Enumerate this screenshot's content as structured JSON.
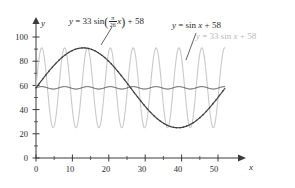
{
  "figure": {
    "background": "#ffffff",
    "axis_color": "#3a3a3a",
    "dark_curve_color": "#3f3f3f",
    "light_curve_color": "#c9c9c9",
    "faint_label_color": "#b9b9b9"
  },
  "axes": {
    "x_name": "x",
    "y_name": "y",
    "x_ticks": [
      "0",
      "10",
      "20",
      "30",
      "40",
      "50"
    ],
    "y_ticks": [
      "0",
      "20",
      "40",
      "60",
      "80",
      "100"
    ],
    "x_tick_values": [
      0,
      10,
      20,
      30,
      40,
      50
    ],
    "y_tick_values": [
      0,
      20,
      40,
      60,
      80,
      100
    ],
    "x_minor_step": 5,
    "y_minor_step": 10
  },
  "labels": {
    "slow_curve": {
      "prefix": "y",
      "equals": "=",
      "amplitude": "33",
      "fn": "sin",
      "open_paren": "(",
      "frac_num": "π",
      "frac_den": "26",
      "var": "x",
      "close_paren": ")",
      "plus": "+",
      "offset": "58",
      "full": "y = 33 sin(π/26 x) + 58"
    },
    "small_curve": {
      "full": "y = sin x + 58",
      "prefix": "y",
      "equals": "=",
      "fn": "sin",
      "var": "x",
      "plus": "+",
      "offset": "58"
    },
    "large_curve": {
      "full": "y = 33 sin x + 58",
      "prefix": "y",
      "equals": "=",
      "amplitude": "33",
      "fn": "sin",
      "var": "x",
      "plus": "+",
      "offset": "58"
    }
  },
  "chart_data": {
    "type": "line",
    "title": "",
    "xlabel": "x",
    "ylabel": "y",
    "xlim": [
      0,
      52
    ],
    "ylim": [
      0,
      105
    ],
    "grid": false,
    "legend": "inline annotations",
    "xticks": [
      0,
      10,
      20,
      30,
      40,
      50
    ],
    "yticks": [
      0,
      20,
      40,
      60,
      80,
      100
    ],
    "series": [
      {
        "name": "y = 33 sin(π/26 x) + 58",
        "expression": "33*sin(pi/26*x)+58",
        "amplitude": 33,
        "period": 52,
        "midline": 58,
        "color": "#3f3f3f",
        "style": "solid-with-dots",
        "domain": [
          0,
          52
        ],
        "max": 91,
        "min": 25,
        "x_at_max": 13,
        "x_at_min": 39,
        "sample_points": [
          {
            "x": 0,
            "y": 58
          },
          {
            "x": 6.5,
            "y": 81.3
          },
          {
            "x": 13,
            "y": 91
          },
          {
            "x": 19.5,
            "y": 81.3
          },
          {
            "x": 26,
            "y": 58
          },
          {
            "x": 32.5,
            "y": 34.7
          },
          {
            "x": 39,
            "y": 25
          },
          {
            "x": 45.5,
            "y": 34.7
          },
          {
            "x": 52,
            "y": 58
          }
        ]
      },
      {
        "name": "y = 33 sin x + 58",
        "expression": "33*sin(x)+58",
        "amplitude": 33,
        "period": 6.283,
        "midline": 58,
        "color": "#c9c9c9",
        "style": "solid",
        "domain": [
          0,
          52
        ],
        "max": 91,
        "min": 25
      },
      {
        "name": "y = sin x + 58",
        "expression": "sin(x)+58",
        "amplitude": 1,
        "period": 6.283,
        "midline": 58,
        "color": "#3f3f3f",
        "style": "solid",
        "domain": [
          0,
          52
        ],
        "max": 59,
        "min": 57
      }
    ]
  }
}
